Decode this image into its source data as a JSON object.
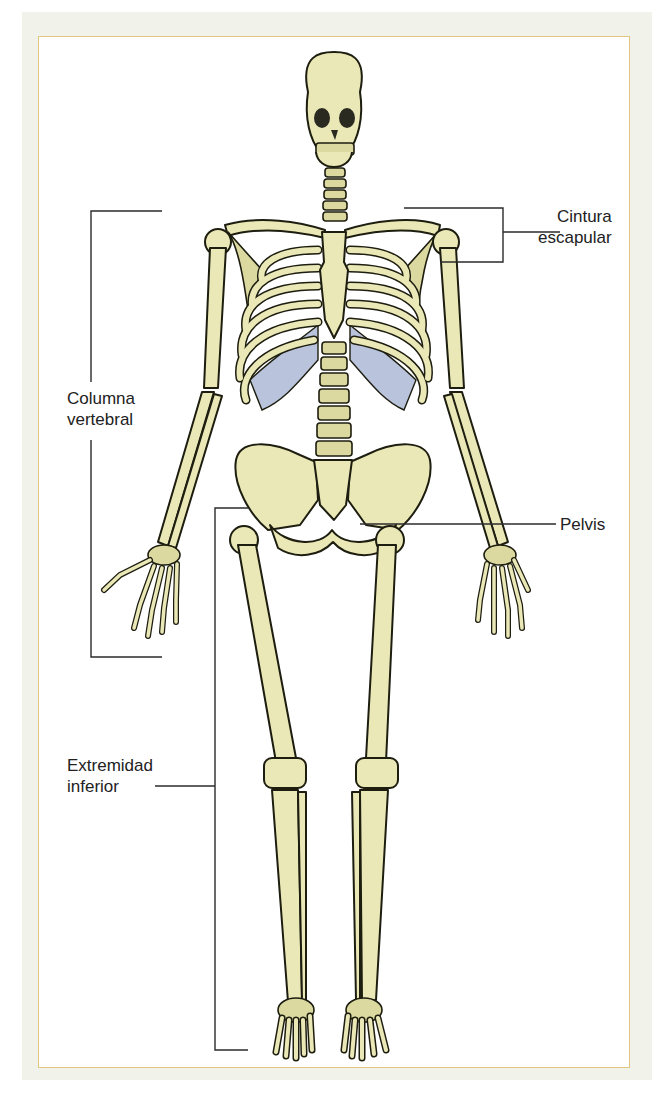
{
  "figure": {
    "colors": {
      "bone": "#ebe8b7",
      "cartilage": "#b9c4dc",
      "panel_border": "#e0c680",
      "background": "#f1f3ea"
    }
  },
  "labels": {
    "cintura_escapular": {
      "line1": "Cintura",
      "line2": "escapular"
    },
    "columna_vertebral": {
      "line1": "Columna",
      "line2": "vertebral"
    },
    "pelvis": {
      "line1": "Pelvis"
    },
    "extremidad_inferior": {
      "line1": "Extremidad",
      "line2": "inferior"
    }
  }
}
